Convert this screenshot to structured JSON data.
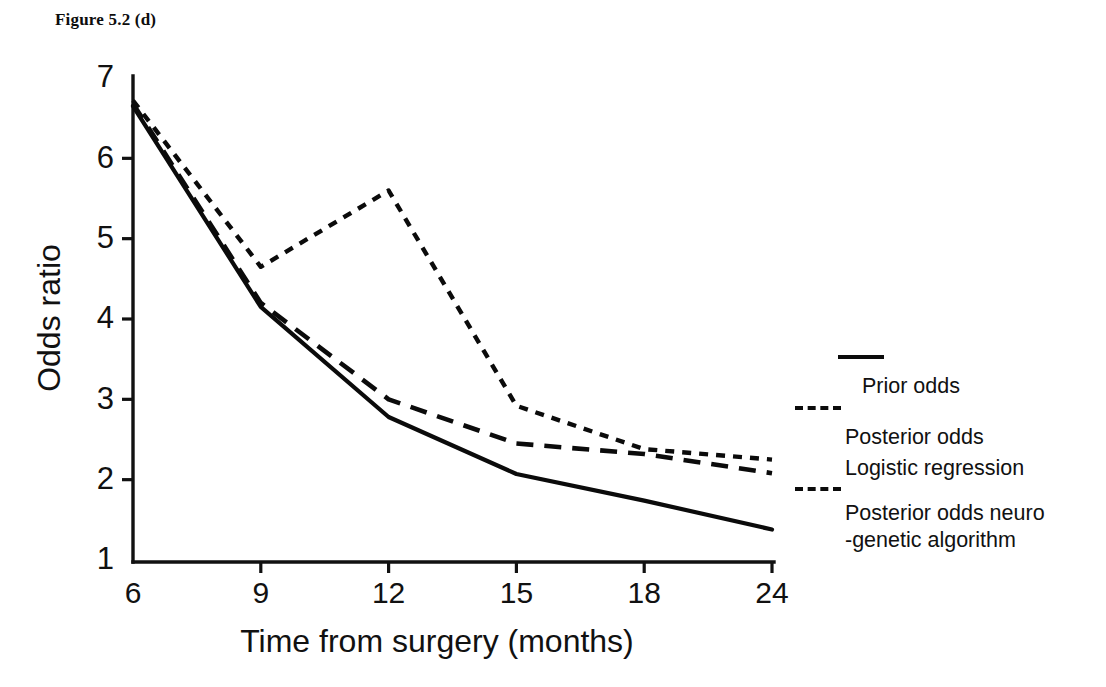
{
  "figure": {
    "title": "Figure 5.2 (d)"
  },
  "legend": {
    "items": [
      {
        "label": "Prior odds",
        "style": "solid"
      },
      {
        "label": "Posterior odds",
        "style": "dashed"
      },
      {
        "label": "Logistic regression",
        "style": "dotted"
      },
      {
        "label": "Posterior odds neuro\n-genetic algorithm",
        "style": "none"
      }
    ]
  },
  "chart_data": {
    "type": "line",
    "title": "Figure 5.2 (d)",
    "xlabel": "Time from surgery (months)",
    "ylabel": "Odds ratio",
    "categories": [
      "6",
      "9",
      "12",
      "15",
      "18",
      "24"
    ],
    "x_tick_labels": [
      "6",
      "9",
      "12",
      "15",
      "18",
      "24"
    ],
    "y_tick_labels": [
      "1",
      "2",
      "3",
      "4",
      "5",
      "6",
      "7"
    ],
    "y_ticks": [
      1,
      2,
      3,
      4,
      5,
      6,
      7
    ],
    "ylim": [
      1,
      7
    ],
    "grid": false,
    "legend_position": "right",
    "series": [
      {
        "name": "Prior odds",
        "style": "solid",
        "values": [
          6.65,
          4.15,
          2.78,
          2.07,
          1.74,
          1.38
        ]
      },
      {
        "name": "Posterior odds",
        "style": "dashed",
        "values": [
          6.68,
          4.2,
          3.0,
          2.45,
          2.32,
          2.08
        ]
      },
      {
        "name": "Logistic regression",
        "style": "dotted",
        "values": [
          6.72,
          4.65,
          5.6,
          2.92,
          2.38,
          2.25
        ]
      }
    ]
  }
}
